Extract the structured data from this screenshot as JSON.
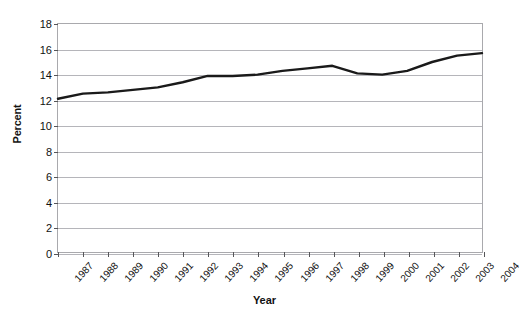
{
  "chart_data": {
    "type": "line",
    "title": "",
    "xlabel": "Year",
    "ylabel": "Percent",
    "ylim": [
      0,
      18
    ],
    "ytick_step": 2,
    "yticks": [
      0,
      2,
      4,
      6,
      8,
      10,
      12,
      14,
      16,
      18
    ],
    "grid": true,
    "legend": "none",
    "line_color": "#1a1a1a",
    "categories": [
      "1987",
      "1988",
      "1989",
      "1990",
      "1991",
      "1992",
      "1993",
      "1994",
      "1995",
      "1996",
      "1997",
      "1998",
      "1999",
      "2000",
      "2001",
      "2002",
      "2003",
      "2004"
    ],
    "series": [
      {
        "name": "Percent",
        "values": [
          12.1,
          12.5,
          12.6,
          12.8,
          13.0,
          13.4,
          13.9,
          13.9,
          14.0,
          14.3,
          14.5,
          14.7,
          14.1,
          14.0,
          14.3,
          15.0,
          15.5,
          15.7
        ]
      }
    ]
  }
}
